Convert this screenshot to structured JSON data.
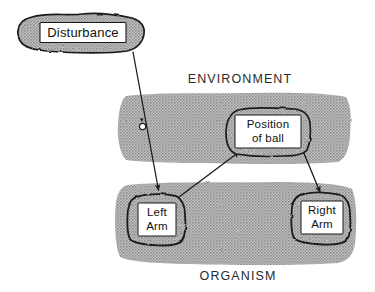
{
  "figure": {
    "background_color": "#ffffff",
    "ink_color": "#1a1a1a",
    "band_fill_color": "#a8a8a8",
    "label_box_fill": "#ffffff"
  },
  "regions": [
    {
      "id": "environment",
      "label": "ENVIRONMENT",
      "label_position": "above-band"
    },
    {
      "id": "organism",
      "label": "ORGANISM",
      "label_position": "below-band"
    }
  ],
  "nodes": [
    {
      "id": "disturbance",
      "label": "Disturbance",
      "lines": [
        "Disturbance"
      ],
      "region": "outside"
    },
    {
      "id": "position-of-ball",
      "label": "Position of ball",
      "lines": [
        "Position",
        "of ball"
      ],
      "region": "environment"
    },
    {
      "id": "left-arm",
      "label": "Left Arm",
      "lines": [
        "Left",
        "Arm"
      ],
      "region": "organism"
    },
    {
      "id": "right-arm",
      "label": "Right Arm",
      "lines": [
        "Right",
        "Arm"
      ],
      "region": "organism"
    }
  ],
  "arrows": [
    {
      "id": "disturbance-to-left-arm",
      "from": "disturbance",
      "to": "left-arm",
      "marker": "circle",
      "has_midpoint_arrowhead": true
    },
    {
      "id": "left-arm-to-position-of-ball",
      "from": "left-arm",
      "to": "position-of-ball",
      "marker": "none",
      "has_midpoint_arrowhead": false
    },
    {
      "id": "position-of-ball-to-right-arm",
      "from": "position-of-ball",
      "to": "right-arm",
      "marker": "none",
      "has_midpoint_arrowhead": false
    }
  ]
}
